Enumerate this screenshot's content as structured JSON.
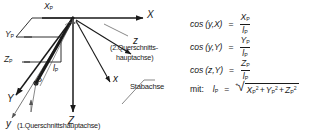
{
  "diagram": {
    "axes": {
      "global_x": "X",
      "global_y": "Y",
      "global_z": "Z",
      "local_x": "x",
      "local_y": "y",
      "local_z": "z"
    },
    "point_label": "P",
    "components": {
      "xp": "X",
      "xp_sub": "P",
      "yp": "Y",
      "yp_sub": "P",
      "zp": "Z",
      "zp_sub": "P",
      "lp": "l",
      "lp_sub": "P"
    },
    "annotations": {
      "second_axis_line1": "(2.Querschnitts-",
      "second_axis_line2": "hauptachse)",
      "first_axis": "(1.Querschnittshauptachse)",
      "member_axis": "Stabachse"
    }
  },
  "equations": [
    {
      "id": "cos-y-X",
      "lhs": "cos (y,X)",
      "equals": "=",
      "numerator": "X",
      "numerator_sub": "P",
      "denominator": "l",
      "denominator_sub": "P"
    },
    {
      "id": "cos-y-Y",
      "lhs": "cos (y,Y)",
      "equals": "=",
      "numerator": "Y",
      "numerator_sub": "P",
      "denominator": "l",
      "denominator_sub": "P"
    },
    {
      "id": "cos-z-Y",
      "lhs": "cos (z,Y)",
      "equals": "=",
      "numerator": "Z",
      "numerator_sub": "P",
      "denominator": "l",
      "denominator_sub": "P"
    }
  ],
  "definition": {
    "prefix": "mit:",
    "symbol": "l",
    "symbol_sub": "P",
    "equals": "=",
    "sign": "+",
    "radical": "√",
    "radicand_terms": [
      {
        "base": "X",
        "sub": "P",
        "sup": "2"
      },
      {
        "base": "Y",
        "sub": "P",
        "sup": "2"
      },
      {
        "base": "Z",
        "sub": "P",
        "sup": "2"
      }
    ],
    "plus": "+"
  },
  "colors": {
    "ink": "#1a1a1a",
    "thin": "#555555",
    "background": "#ffffff"
  }
}
